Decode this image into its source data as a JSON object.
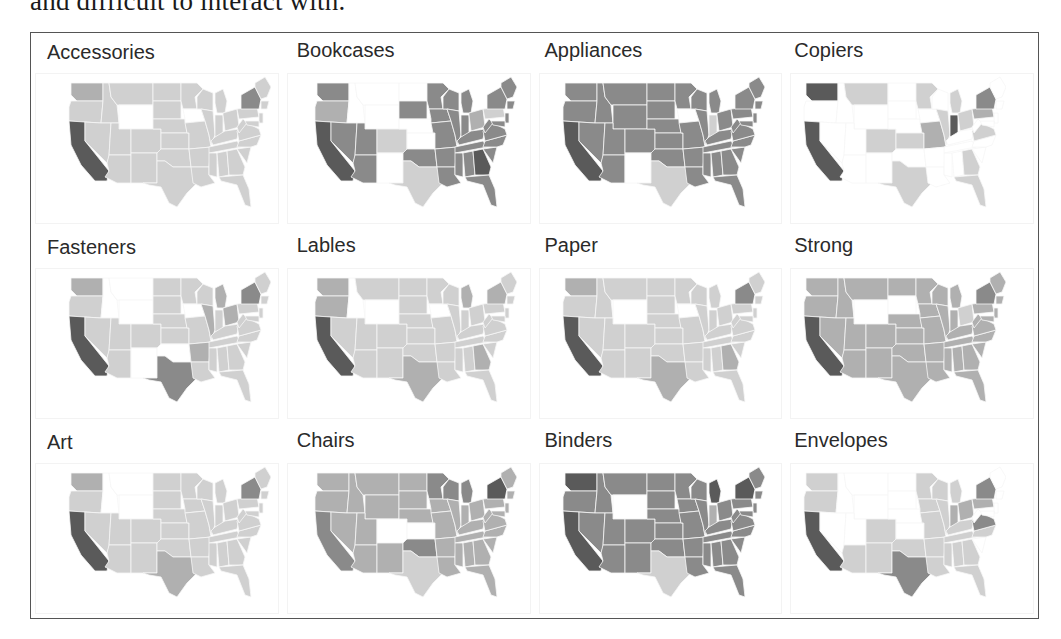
{
  "caption_fragment": "and difficult to interact with.",
  "shade_colors": [
    "#ffffff",
    "#d0d0d0",
    "#b0b0b0",
    "#8a8a8a",
    "#5a5a5a"
  ],
  "chart_data": {
    "type": "heatmap",
    "subtype": "choropleth-small-multiples",
    "title": "",
    "layout": {
      "rows": 3,
      "cols": 4,
      "legend": "none",
      "axes": "none"
    },
    "panels": [
      {
        "title": "Accessories",
        "shades": {
          "CA": 4,
          "WA": 2,
          "NY": 3,
          "WY": 0,
          "IA": 0,
          "default": 1
        }
      },
      {
        "title": "Bookcases",
        "shades": {
          "CA": 4,
          "WA": 3,
          "OR": 2,
          "NV": 3,
          "AZ": 3,
          "UT": 3,
          "CO": 1,
          "SD": 3,
          "TX": 1,
          "NM": 0,
          "WY": 0,
          "MT": 0,
          "ID": 0,
          "ND": 0,
          "NE": 0,
          "KS": 0,
          "OK": 3,
          "MN": 3,
          "WI": 3,
          "MI": 3,
          "IL": 3,
          "MO": 3,
          "AR": 3,
          "LA": 3,
          "GA": 4,
          "FL": 3,
          "NY": 3,
          "PA": 1,
          "OH": 2,
          "KY": 3,
          "TN": 3,
          "VA": 3,
          "NC": 3,
          "default": 3
        }
      },
      {
        "title": "Appliances",
        "shades": {
          "CA": 4,
          "TX": 1,
          "IA": 0,
          "NM": 0,
          "IN": 1,
          "NY": 3,
          "default": 3
        }
      },
      {
        "title": "Copiers",
        "shades": {
          "WA": 4,
          "CA": 4,
          "MT": 1,
          "CO": 1,
          "KS": 1,
          "TX": 1,
          "MN": 1,
          "MI": 1,
          "MO": 2,
          "IL": 1,
          "IN": 4,
          "OH": 1,
          "PA": 2,
          "NY": 3,
          "VA": 1,
          "GA": 1,
          "FL": 1,
          "default": 0
        }
      },
      {
        "title": "Fasteners",
        "shades": {
          "CA": 4,
          "WA": 2,
          "TX": 3,
          "NY": 3,
          "OH": 2,
          "IL": 2,
          "MI": 2,
          "AR": 2,
          "ID": 0,
          "MT": 0,
          "WY": 0,
          "NM": 0,
          "OK": 0,
          "IA": 0,
          "default": 1
        }
      },
      {
        "title": "Lables",
        "shades": {
          "CA": 4,
          "WA": 2,
          "OR": 2,
          "MI": 2,
          "NY": 2,
          "TX": 2,
          "GA": 2,
          "ID": 0,
          "WY": 0,
          "IA": 0,
          "default": 1
        }
      },
      {
        "title": "Paper",
        "shades": {
          "CA": 4,
          "WA": 2,
          "NY": 3,
          "TX": 2,
          "GA": 2,
          "WY": 0,
          "IA": 0,
          "default": 1
        }
      },
      {
        "title": "Strong",
        "shades": {
          "CA": 4,
          "WA": 2,
          "NY": 3,
          "WY": 0,
          "SD": 0,
          "OH": 1,
          "default": 2
        }
      },
      {
        "title": "Art",
        "shades": {
          "CA": 4,
          "WA": 2,
          "NY": 3,
          "TX": 2,
          "ID": 0,
          "MT": 0,
          "WY": 0,
          "default": 1
        }
      },
      {
        "title": "Chairs",
        "shades": {
          "CA": 3,
          "WA": 2,
          "MN": 3,
          "WI": 3,
          "MI": 3,
          "NY": 4,
          "OK": 3,
          "CO": 0,
          "KS": 0,
          "TX": 1,
          "default": 2
        }
      },
      {
        "title": "Binders",
        "shades": {
          "CA": 4,
          "WA": 4,
          "WY": 0,
          "TX": 1,
          "MI": 4,
          "NY": 4,
          "IN": 2,
          "default": 3
        }
      },
      {
        "title": "Envelopes",
        "shades": {
          "CA": 4,
          "WA": 1,
          "OR": 1,
          "TX": 3,
          "NY": 3,
          "VA": 3,
          "CO": 1,
          "NM": 1,
          "AZ": 1,
          "MN": 1,
          "WI": 1,
          "MI": 1,
          "IL": 1,
          "IN": 2,
          "OH": 2,
          "PA": 2,
          "OK": 1,
          "AR": 1,
          "LA": 1,
          "MS": 1,
          "AL": 1,
          "GA": 1,
          "FL": 1,
          "TN": 1,
          "KY": 1,
          "NC": 1,
          "MO": 1,
          "IA": 1,
          "default": 0
        }
      }
    ]
  },
  "panels": [
    {
      "title": "Accessories"
    },
    {
      "title": "Bookcases"
    },
    {
      "title": "Appliances"
    },
    {
      "title": "Copiers"
    },
    {
      "title": "Fasteners"
    },
    {
      "title": "Lables"
    },
    {
      "title": "Paper"
    },
    {
      "title": "Strong"
    },
    {
      "title": "Art"
    },
    {
      "title": "Chairs"
    },
    {
      "title": "Binders"
    },
    {
      "title": "Envelopes"
    }
  ]
}
